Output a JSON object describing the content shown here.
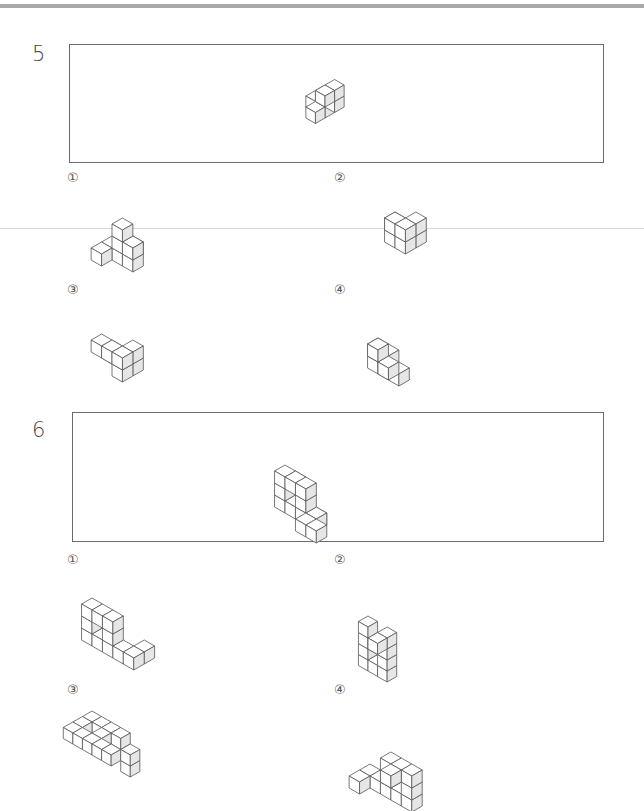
{
  "questions": [
    {
      "number": "5",
      "options": [
        {
          "label": "①"
        },
        {
          "label": "②"
        },
        {
          "label": "③"
        },
        {
          "label": "④"
        }
      ]
    },
    {
      "number": "6",
      "options": [
        {
          "label": "①"
        },
        {
          "label": "②"
        },
        {
          "label": "③"
        },
        {
          "label": "④"
        }
      ]
    }
  ],
  "colors": {
    "border": "#6a6a6a",
    "shade": "#e6e6e6",
    "line": "#555555",
    "top_rule": "#a9a9a9"
  },
  "figures": {
    "q5_reference": {
      "scale": 11,
      "cubes": [
        [
          0,
          0,
          0
        ],
        [
          0,
          0,
          1
        ],
        [
          1,
          0,
          1
        ],
        [
          1,
          0,
          2
        ],
        [
          0,
          1,
          0
        ],
        [
          1,
          1,
          2
        ],
        [
          -1,
          0,
          0
        ]
      ]
    },
    "q5_opt1": {
      "scale": 12,
      "cubes": [
        [
          0,
          0,
          0
        ],
        [
          1,
          0,
          0
        ],
        [
          2,
          0,
          0
        ],
        [
          0,
          1,
          0
        ],
        [
          1,
          -1,
          0
        ],
        [
          1,
          0,
          1
        ],
        [
          1,
          0,
          2
        ],
        [
          2,
          0,
          1
        ]
      ]
    },
    "q5_opt2": {
      "scale": 12,
      "cubes": [
        [
          0,
          0,
          0
        ],
        [
          1,
          0,
          0
        ],
        [
          2,
          0,
          0
        ],
        [
          1,
          1,
          0
        ],
        [
          2,
          1,
          0
        ],
        [
          2,
          0,
          1
        ],
        [
          2,
          1,
          1
        ],
        [
          1,
          1,
          1
        ]
      ]
    },
    "q5_opt3": {
      "scale": 12,
      "cubes": [
        [
          0,
          0,
          0
        ],
        [
          1,
          0,
          0
        ],
        [
          2,
          0,
          0
        ],
        [
          2,
          1,
          0
        ],
        [
          2,
          0,
          1
        ],
        [
          0,
          1,
          1
        ],
        [
          1,
          1,
          1
        ],
        [
          2,
          1,
          1
        ]
      ]
    },
    "q5_opt4": {
      "scale": 12,
      "cubes": [
        [
          0,
          0,
          0
        ],
        [
          0,
          0,
          1
        ],
        [
          1,
          0,
          1
        ],
        [
          1,
          1,
          2
        ],
        [
          2,
          0,
          0
        ],
        [
          2,
          1,
          1
        ],
        [
          1,
          0,
          0
        ]
      ]
    },
    "q6_reference": {
      "scale": 12,
      "cubes": [
        [
          0,
          0,
          0
        ],
        [
          1,
          0,
          0
        ],
        [
          2,
          0,
          0
        ],
        [
          3,
          0,
          0
        ],
        [
          0,
          0,
          1
        ],
        [
          2,
          0,
          1
        ],
        [
          0,
          0,
          2
        ],
        [
          1,
          0,
          2
        ],
        [
          2,
          0,
          2
        ],
        [
          3,
          1,
          0
        ],
        [
          4,
          1,
          0
        ],
        [
          3,
          0,
          0
        ],
        [
          0,
          -1,
          1
        ]
      ]
    },
    "q6_opt1": {
      "scale": 12,
      "cubes": [
        [
          0,
          0,
          0
        ],
        [
          1,
          0,
          0
        ],
        [
          2,
          0,
          0
        ],
        [
          3,
          0,
          0
        ],
        [
          4,
          0,
          0
        ],
        [
          0,
          0,
          1
        ],
        [
          2,
          0,
          1
        ],
        [
          0,
          0,
          2
        ],
        [
          1,
          0,
          2
        ],
        [
          2,
          0,
          2
        ],
        [
          4,
          -1,
          0
        ]
      ]
    },
    "q6_opt2": {
      "scale": 11,
      "cubes": [
        [
          0,
          0,
          0
        ],
        [
          1,
          0,
          0
        ],
        [
          2,
          0,
          0
        ],
        [
          0,
          0,
          1
        ],
        [
          2,
          0,
          1
        ],
        [
          0,
          0,
          2
        ],
        [
          1,
          0,
          2
        ],
        [
          2,
          0,
          2
        ],
        [
          0,
          0,
          3
        ],
        [
          2,
          1,
          3
        ],
        [
          2,
          0,
          3
        ]
      ]
    },
    "q6_opt3": {
      "scale": 11,
      "cubes": [
        [
          0,
          0,
          0
        ],
        [
          1,
          0,
          0
        ],
        [
          2,
          0,
          0
        ],
        [
          3,
          0,
          0
        ],
        [
          0,
          1,
          0
        ],
        [
          2,
          1,
          0
        ],
        [
          0,
          2,
          0
        ],
        [
          1,
          2,
          0
        ],
        [
          2,
          2,
          0
        ],
        [
          3,
          2,
          0
        ],
        [
          4,
          2,
          0
        ],
        [
          5,
          1,
          0
        ],
        [
          5,
          1,
          -1
        ]
      ]
    },
    "q6_opt4": {
      "scale": 12,
      "cubes": [
        [
          0,
          0,
          0
        ],
        [
          1,
          0,
          0
        ],
        [
          2,
          0,
          0
        ],
        [
          3,
          0,
          0
        ],
        [
          4,
          0,
          0
        ],
        [
          0,
          1,
          0
        ],
        [
          2,
          0,
          1
        ],
        [
          4,
          0,
          1
        ],
        [
          2,
          0,
          2
        ],
        [
          3,
          0,
          2
        ],
        [
          4,
          0,
          2
        ],
        [
          3,
          1,
          2
        ]
      ]
    }
  }
}
